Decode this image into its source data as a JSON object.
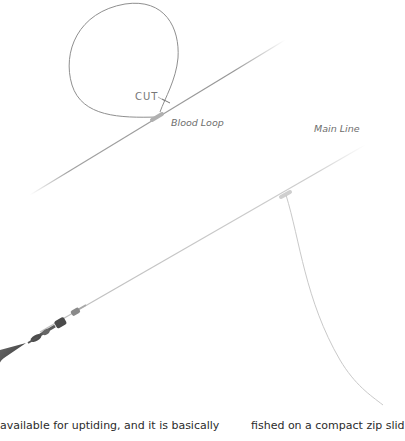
{
  "diagram": {
    "labels": {
      "cut": "CUT",
      "blood_loop": "Blood Loop",
      "main_line": "Main Line"
    },
    "components": [
      {
        "name": "blood-loop",
        "type": "loop of line above upper main line"
      },
      {
        "name": "upper-main-line",
        "type": "diagonal line"
      },
      {
        "name": "lower-main-line",
        "type": "diagonal line with swivel/lead"
      },
      {
        "name": "snood",
        "type": "curved dropper line from knot"
      },
      {
        "name": "lead-weight",
        "type": "sinker with swivels at bottom-left"
      }
    ],
    "colors": {
      "line": "#8a8a8a",
      "light_line": "#bdbdbd",
      "label": "#6e6e6e",
      "body_text": "#2b2b2b"
    }
  },
  "body_text": {
    "left_column": "available for uptiding, and it is basically",
    "right_column": "fished on a compact zip slid"
  }
}
